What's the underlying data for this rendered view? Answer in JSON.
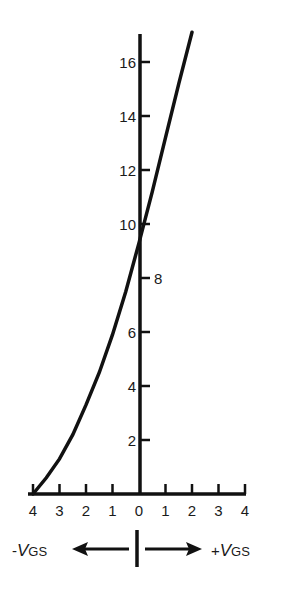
{
  "chart_data": {
    "type": "line",
    "title": "",
    "xlabel_left": "-V_GS",
    "xlabel_right": "+V_GS",
    "x_tick_labels": [
      "4",
      "3",
      "2",
      "1",
      "0",
      "1",
      "2",
      "3",
      "4"
    ],
    "x_ticks_signed": [
      -4,
      -3,
      -2,
      -1,
      0,
      1,
      2,
      3,
      4
    ],
    "y_tick_labels": [
      "2",
      "4",
      "6",
      "8",
      "10",
      "12",
      "14",
      "16"
    ],
    "y_ticks": [
      2,
      4,
      6,
      8,
      10,
      12,
      14,
      16
    ],
    "xlim": [
      -4,
      4
    ],
    "ylim": [
      0,
      17
    ],
    "grid": false,
    "legend": null,
    "series": [
      {
        "name": "I_D transfer curve",
        "x": [
          -4,
          -3.5,
          -3,
          -2.5,
          -2,
          -1.5,
          -1,
          -0.5,
          0,
          0.5,
          1,
          1.5,
          2
        ],
        "y": [
          0,
          0.6,
          1.3,
          2.2,
          3.3,
          4.5,
          5.9,
          7.5,
          9.3,
          11.2,
          13.2,
          15.2,
          17.1
        ]
      }
    ],
    "annotations": [
      {
        "text": "-V_GS",
        "position": "bottom-left",
        "arrow": "left"
      },
      {
        "text": "+V_GS",
        "position": "bottom-right",
        "arrow": "right"
      }
    ]
  },
  "labels": {
    "neg_vgs_sign": "-",
    "pos_vgs_sign": "+",
    "v": "V",
    "gs": "GS"
  },
  "colors": {
    "ink": "#111111",
    "background": "#ffffff"
  }
}
